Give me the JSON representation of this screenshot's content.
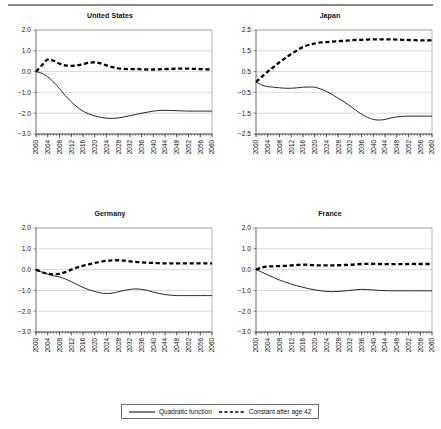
{
  "figure": {
    "panel_layout": "2x2",
    "legend": {
      "entries": [
        {
          "label": "Quadratic function",
          "style": "solid",
          "color": "#000000"
        },
        {
          "label": "Constant after age 42",
          "style": "dashed",
          "color": "#000000"
        }
      ]
    }
  },
  "chart_data": [
    {
      "type": "line",
      "title": "United States",
      "xlabel": "",
      "ylabel": "",
      "xlim": [
        2000,
        2060
      ],
      "ylim": [
        -3.0,
        2.0
      ],
      "yticks": [
        2.0,
        1.0,
        0.0,
        -1.0,
        -2.0,
        -3.0
      ],
      "ytick_labels": [
        "2.0",
        "1.0",
        "0.0",
        "-1.0",
        "-2.0",
        "-3.0"
      ],
      "xticks": [
        2000,
        2004,
        2008,
        2012,
        2016,
        2020,
        2024,
        2028,
        2032,
        2036,
        2040,
        2044,
        2048,
        2052,
        2056,
        2060
      ],
      "xtick_labels": [
        "2000",
        "2004",
        "2008",
        "2012",
        "2016",
        "2020",
        "2024",
        "2028",
        "2032",
        "2036",
        "2040",
        "2044",
        "2048",
        "2052",
        "2056",
        "2060"
      ],
      "minor_xticks_interval": 1,
      "grid": "horizontal",
      "legend_position": "figure-bottom",
      "x": [
        2000,
        2002,
        2004,
        2006,
        2008,
        2010,
        2012,
        2014,
        2016,
        2018,
        2020,
        2022,
        2024,
        2026,
        2028,
        2030,
        2032,
        2034,
        2036,
        2038,
        2040,
        2042,
        2044,
        2046,
        2048,
        2050,
        2052,
        2054,
        2056,
        2058,
        2060
      ],
      "series": [
        {
          "name": "Quadratic function",
          "style": "solid",
          "values": [
            0.0,
            -0.08,
            -0.25,
            -0.5,
            -0.82,
            -1.15,
            -1.45,
            -1.7,
            -1.9,
            -2.03,
            -2.13,
            -2.2,
            -2.24,
            -2.25,
            -2.23,
            -2.18,
            -2.12,
            -2.06,
            -2.0,
            -1.95,
            -1.9,
            -1.87,
            -1.86,
            -1.87,
            -1.88,
            -1.89,
            -1.9,
            -1.9,
            -1.9,
            -1.9,
            -1.9
          ]
        },
        {
          "name": "Constant after age 42",
          "style": "dashed",
          "values": [
            0.0,
            0.3,
            0.58,
            0.52,
            0.38,
            0.3,
            0.28,
            0.3,
            0.36,
            0.42,
            0.45,
            0.4,
            0.3,
            0.22,
            0.16,
            0.13,
            0.12,
            0.12,
            0.11,
            0.1,
            0.1,
            0.11,
            0.12,
            0.13,
            0.14,
            0.14,
            0.14,
            0.13,
            0.12,
            0.11,
            0.1
          ]
        }
      ]
    },
    {
      "type": "line",
      "title": "Japan",
      "xlabel": "",
      "ylabel": "",
      "xlim": [
        2000,
        2060
      ],
      "ylim": [
        -2.5,
        2.5
      ],
      "yticks": [
        2.5,
        1.5,
        0.5,
        -0.5,
        -1.5,
        -2.5
      ],
      "ytick_labels": [
        "2.5",
        "1.5",
        "0.5",
        "-0.5",
        "-1.5",
        "-2.5"
      ],
      "xticks": [
        2000,
        2004,
        2008,
        2012,
        2016,
        2020,
        2024,
        2028,
        2032,
        2036,
        2040,
        2044,
        2048,
        2052,
        2056,
        2060
      ],
      "xtick_labels": [
        "2000",
        "2004",
        "2008",
        "2012",
        "2016",
        "2020",
        "2024",
        "2028",
        "2032",
        "2036",
        "2040",
        "2044",
        "2048",
        "2052",
        "2056",
        "2060"
      ],
      "minor_xticks_interval": 1,
      "grid": "horizontal",
      "legend_position": "figure-bottom",
      "x": [
        2000,
        2002,
        2004,
        2006,
        2008,
        2010,
        2012,
        2014,
        2016,
        2018,
        2020,
        2022,
        2024,
        2026,
        2028,
        2030,
        2032,
        2034,
        2036,
        2038,
        2040,
        2042,
        2044,
        2046,
        2048,
        2050,
        2052,
        2054,
        2056,
        2058,
        2060
      ],
      "series": [
        {
          "name": "Quadratic function",
          "style": "solid",
          "values": [
            0.0,
            -0.15,
            -0.22,
            -0.25,
            -0.28,
            -0.3,
            -0.3,
            -0.28,
            -0.25,
            -0.24,
            -0.25,
            -0.33,
            -0.45,
            -0.6,
            -0.78,
            -0.95,
            -1.15,
            -1.35,
            -1.55,
            -1.7,
            -1.8,
            -1.83,
            -1.8,
            -1.73,
            -1.68,
            -1.65,
            -1.64,
            -1.64,
            -1.64,
            -1.64,
            -1.64
          ]
        },
        {
          "name": "Constant after age 42",
          "style": "dashed",
          "values": [
            0.0,
            0.25,
            0.5,
            0.72,
            0.95,
            1.15,
            1.35,
            1.52,
            1.68,
            1.78,
            1.85,
            1.9,
            1.92,
            1.94,
            1.96,
            1.98,
            2.0,
            2.02,
            2.03,
            2.04,
            2.05,
            2.05,
            2.05,
            2.05,
            2.04,
            2.03,
            2.02,
            2.01,
            2.0,
            2.0,
            2.0
          ]
        }
      ]
    },
    {
      "type": "line",
      "title": "Germany",
      "xlabel": "",
      "ylabel": "",
      "xlim": [
        2000,
        2060
      ],
      "ylim": [
        -3.0,
        2.0
      ],
      "yticks": [
        2.0,
        1.0,
        0.0,
        -1.0,
        -2.0,
        -3.0
      ],
      "ytick_labels": [
        "2.0",
        "1.0",
        "0.0",
        "-1.0",
        "-2.0",
        "-3.0"
      ],
      "xticks": [
        2000,
        2004,
        2008,
        2012,
        2016,
        2020,
        2024,
        2028,
        2032,
        2036,
        2040,
        2044,
        2048,
        2052,
        2056,
        2060
      ],
      "xtick_labels": [
        "2000",
        "2004",
        "2008",
        "2012",
        "2016",
        "2020",
        "2024",
        "2028",
        "2032",
        "2036",
        "2040",
        "2044",
        "2048",
        "2052",
        "2056",
        "2060"
      ],
      "minor_xticks_interval": 1,
      "grid": "horizontal",
      "legend_position": "figure-bottom",
      "x": [
        2000,
        2002,
        2004,
        2006,
        2008,
        2010,
        2012,
        2014,
        2016,
        2018,
        2020,
        2022,
        2024,
        2026,
        2028,
        2030,
        2032,
        2034,
        2036,
        2038,
        2040,
        2042,
        2044,
        2046,
        2048,
        2050,
        2052,
        2054,
        2056,
        2058,
        2060
      ],
      "series": [
        {
          "name": "Quadratic function",
          "style": "solid",
          "values": [
            0.0,
            -0.12,
            -0.22,
            -0.3,
            -0.35,
            -0.45,
            -0.58,
            -0.72,
            -0.85,
            -0.97,
            -1.05,
            -1.12,
            -1.15,
            -1.13,
            -1.07,
            -1.0,
            -0.95,
            -0.93,
            -0.95,
            -1.0,
            -1.08,
            -1.15,
            -1.2,
            -1.23,
            -1.25,
            -1.25,
            -1.25,
            -1.25,
            -1.25,
            -1.25,
            -1.25
          ]
        },
        {
          "name": "Constant after age 42",
          "style": "dashed",
          "values": [
            0.0,
            -0.12,
            -0.2,
            -0.22,
            -0.2,
            -0.12,
            0.0,
            0.1,
            0.18,
            0.25,
            0.32,
            0.38,
            0.42,
            0.44,
            0.45,
            0.43,
            0.4,
            0.37,
            0.35,
            0.33,
            0.32,
            0.31,
            0.3,
            0.3,
            0.3,
            0.3,
            0.3,
            0.3,
            0.3,
            0.3,
            0.3
          ]
        }
      ]
    },
    {
      "type": "line",
      "title": "France",
      "xlabel": "",
      "ylabel": "",
      "xlim": [
        2000,
        2060
      ],
      "ylim": [
        -3.0,
        2.0
      ],
      "yticks": [
        2.0,
        1.0,
        0.0,
        -1.0,
        -2.0,
        -3.0
      ],
      "ytick_labels": [
        "2.0",
        "1.0",
        "0.0",
        "-1.0",
        "-2.0",
        "-3.0"
      ],
      "xticks": [
        2000,
        2004,
        2008,
        2012,
        2016,
        2020,
        2024,
        2028,
        2032,
        2036,
        2040,
        2044,
        2048,
        2052,
        2056,
        2060
      ],
      "xtick_labels": [
        "2000",
        "2004",
        "2008",
        "2012",
        "2016",
        "2020",
        "2024",
        "2028",
        "2032",
        "2036",
        "2040",
        "2044",
        "2048",
        "2052",
        "2056",
        "2060"
      ],
      "minor_xticks_interval": 1,
      "grid": "horizontal",
      "legend_position": "figure-bottom",
      "x": [
        2000,
        2002,
        2004,
        2006,
        2008,
        2010,
        2012,
        2014,
        2016,
        2018,
        2020,
        2022,
        2024,
        2026,
        2028,
        2030,
        2032,
        2034,
        2036,
        2038,
        2040,
        2042,
        2044,
        2046,
        2048,
        2050,
        2052,
        2054,
        2056,
        2058,
        2060
      ],
      "series": [
        {
          "name": "Quadratic function",
          "style": "solid",
          "values": [
            0.0,
            -0.12,
            -0.25,
            -0.38,
            -0.5,
            -0.6,
            -0.7,
            -0.78,
            -0.85,
            -0.92,
            -0.97,
            -1.02,
            -1.05,
            -1.06,
            -1.05,
            -1.03,
            -1.0,
            -0.97,
            -0.95,
            -0.96,
            -0.98,
            -1.0,
            -1.01,
            -1.02,
            -1.02,
            -1.02,
            -1.02,
            -1.02,
            -1.02,
            -1.02,
            -1.02
          ]
        },
        {
          "name": "Constant after age 42",
          "style": "dashed",
          "values": [
            0.0,
            0.1,
            0.15,
            0.16,
            0.17,
            0.18,
            0.2,
            0.22,
            0.24,
            0.23,
            0.21,
            0.2,
            0.2,
            0.2,
            0.21,
            0.22,
            0.23,
            0.25,
            0.27,
            0.28,
            0.28,
            0.27,
            0.26,
            0.26,
            0.26,
            0.26,
            0.27,
            0.27,
            0.27,
            0.27,
            0.27
          ]
        }
      ]
    }
  ]
}
